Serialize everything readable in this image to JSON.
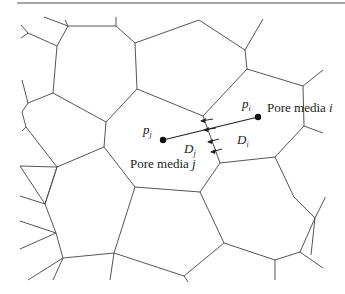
{
  "figure": {
    "type": "voronoi-pore-network",
    "labels": {
      "pore_i_name": "Pore media ",
      "pore_i_index": "i",
      "pore_j_name": "Pore media ",
      "pore_j_index": "j",
      "p_i_symbol": "p",
      "p_i_sub": "i",
      "p_j_symbol": "p",
      "p_j_sub": "j",
      "D_i_symbol": "D",
      "D_i_sub": "i",
      "D_j_symbol": "D",
      "D_j_sub": "j"
    },
    "colors": {
      "edge": "#555555",
      "connector": "#222222",
      "top_rule": "#888888"
    }
  }
}
